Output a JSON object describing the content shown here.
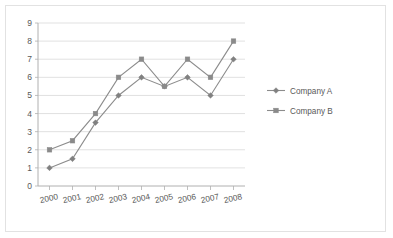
{
  "chart_data": {
    "type": "line",
    "title": "",
    "subtitle": "",
    "xlabel": "",
    "ylabel": "",
    "categories": [
      "2000",
      "2001",
      "2002",
      "2003",
      "2004",
      "2005",
      "2006",
      "2007",
      "2008"
    ],
    "series": [
      {
        "name": "Company A",
        "marker": "diamond",
        "color": "#808080",
        "values": [
          1,
          1.5,
          3.5,
          5,
          6,
          5.5,
          6,
          5,
          7
        ]
      },
      {
        "name": "Company B",
        "marker": "square",
        "color": "#8a8a8a",
        "values": [
          2,
          2.5,
          4,
          6,
          7,
          5.5,
          7,
          6,
          8
        ]
      }
    ],
    "ylim": [
      0,
      9
    ],
    "ystep": 1,
    "yticks": [
      "0",
      "1",
      "2",
      "3",
      "4",
      "5",
      "6",
      "7",
      "8",
      "9"
    ],
    "grid": "horizontal",
    "legend_position": "right",
    "xtick_rotation": "-12"
  },
  "style": {
    "grid_color": "#d9d9d9",
    "axis_color": "#b0b0b0",
    "text_color": "#595959",
    "border_color": "#e2e2e2",
    "background": "#ffffff"
  }
}
